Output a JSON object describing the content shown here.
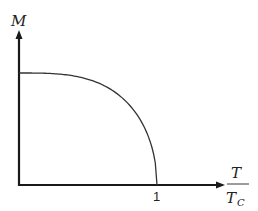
{
  "chart_data": {
    "type": "line",
    "title": "",
    "xlabel": "T / T_C",
    "xlabel_numerator": "T",
    "xlabel_denominator": "T",
    "xlabel_denominator_sub": "C",
    "ylabel": "M",
    "x_ticks": [
      "1"
    ],
    "xlim": [
      0,
      1.45
    ],
    "ylim": [
      0,
      1.5
    ],
    "grid": false,
    "legend": null,
    "series": [
      {
        "name": "Magnetization",
        "x": [
          0,
          0.2,
          0.4,
          0.6,
          0.7,
          0.8,
          0.9,
          0.95,
          0.98,
          1.0
        ],
        "y": [
          1.0,
          0.99,
          0.96,
          0.87,
          0.8,
          0.69,
          0.52,
          0.39,
          0.26,
          0.0
        ]
      }
    ]
  },
  "colors": {
    "axis": "#1a1a1a",
    "curve": "#333333",
    "text": "#222222",
    "background": "#ffffff"
  }
}
